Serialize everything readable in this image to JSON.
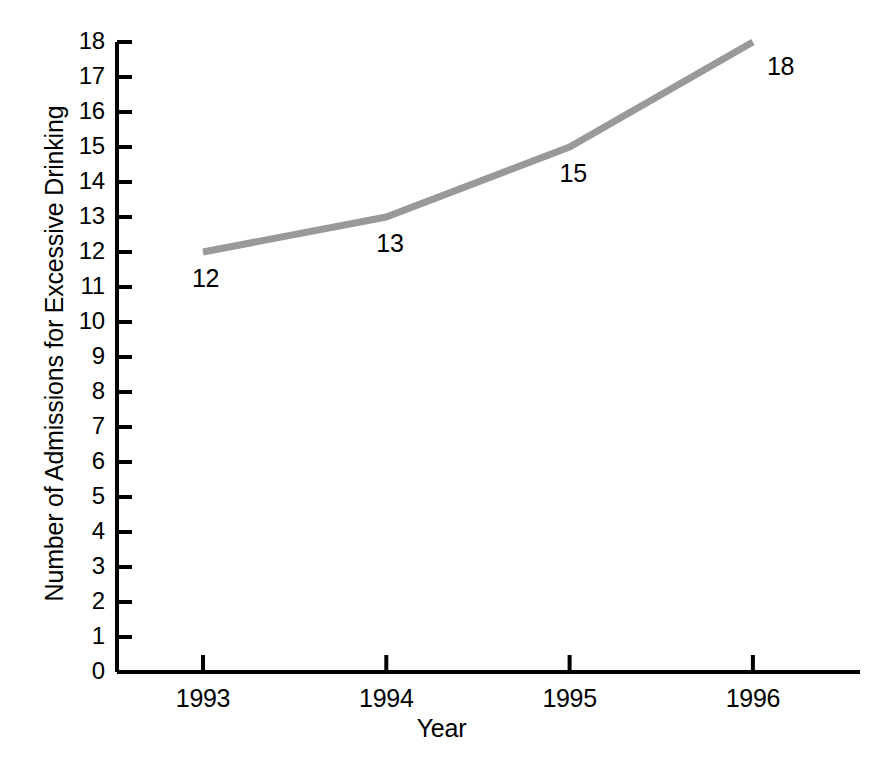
{
  "chart_data": {
    "type": "line",
    "title": "",
    "xlabel": "Year",
    "ylabel": "Number of Admissions for Excessive Drinking",
    "categories": [
      "1993",
      "1994",
      "1995",
      "1996"
    ],
    "x": [
      1993,
      1994,
      1995,
      1996
    ],
    "values": [
      12,
      13,
      15,
      18
    ],
    "point_labels": [
      "12",
      "13",
      "15",
      "18"
    ],
    "series": [
      {
        "name": "Number of Admissions for Excessive Drinking",
        "values": [
          12,
          13,
          15,
          18
        ],
        "color": "#999999"
      }
    ],
    "ylim": [
      0,
      18
    ],
    "xlim": [
      1992.5,
      1996.6
    ],
    "ytick_labels": [
      "0",
      "1",
      "2",
      "3",
      "4",
      "5",
      "6",
      "7",
      "8",
      "9",
      "10",
      "11",
      "12",
      "13",
      "14",
      "15",
      "16",
      "17",
      "18"
    ],
    "ytick_values": [
      0,
      1,
      2,
      3,
      4,
      5,
      6,
      7,
      8,
      9,
      10,
      11,
      12,
      13,
      14,
      15,
      16,
      17,
      18
    ],
    "xtick_labels": [
      "1993",
      "1994",
      "1995",
      "1996"
    ],
    "grid": false,
    "legend": false,
    "legend_position": "none",
    "axis_color": "#000000",
    "line_width_px": 7,
    "marker": "none"
  }
}
